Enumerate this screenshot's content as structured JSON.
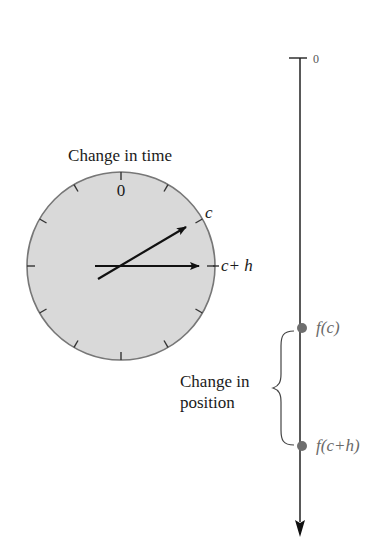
{
  "clock": {
    "title": "Change in time",
    "zero_label": "0",
    "hand_c_label": "c",
    "hand_ch_label": "c+ h",
    "fill_color": "#d9d9d9",
    "stroke_color": "#777777",
    "tick_count": 12
  },
  "position_axis": {
    "origin_label": "0",
    "points": [
      {
        "label": "f(c)",
        "color": "#6e6e6e"
      },
      {
        "label": "f(c+h)",
        "color": "#6e6e6e"
      }
    ],
    "brace_label_line1": "Change in",
    "brace_label_line2": "position"
  }
}
